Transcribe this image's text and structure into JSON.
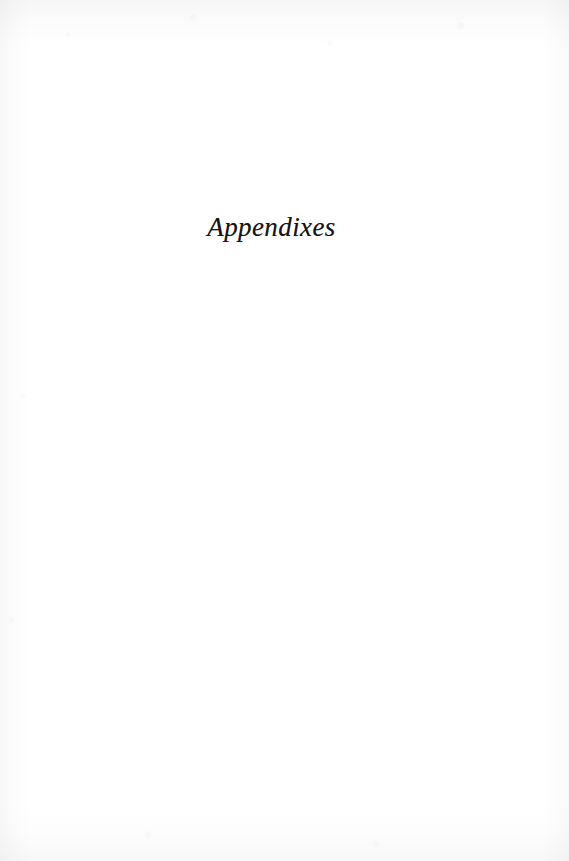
{
  "page": {
    "kind": "book-part-divider-page",
    "background_color": "#ffffff",
    "width": 569,
    "height": 861
  },
  "content": {
    "part_title": "Appendixes",
    "ink_color": "#161616"
  },
  "body_text": "",
  "folio": "",
  "running_head": ""
}
